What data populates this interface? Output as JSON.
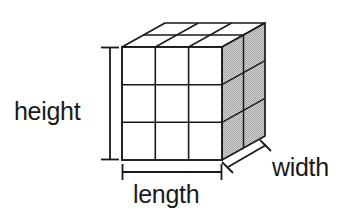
{
  "figure": {
    "type": "3d-rectangular-prism-grid",
    "labels": {
      "height": "height",
      "length": "length",
      "width": "width"
    },
    "grid": {
      "length_units": 3,
      "height_units": 3,
      "width_units": 2,
      "total_unit_cubes": 18
    },
    "colors": {
      "background": "#ffffff",
      "stroke": "#1a1a1a",
      "front_face_fill": "#ffffff",
      "top_face_fill": "#ffffff",
      "side_face_fill": "#c2c2c2",
      "label_text": "#1a1a1a"
    },
    "geometry": {
      "front_left_x": 122,
      "front_right_x": 222,
      "front_top_y": 47,
      "front_bottom_y": 160,
      "depth_dx": 43,
      "depth_dy": -24,
      "height_line_x": 110,
      "length_line_y": 172,
      "width_line_from": [
        228,
        167
      ],
      "width_line_to": [
        266,
        145
      ]
    }
  }
}
